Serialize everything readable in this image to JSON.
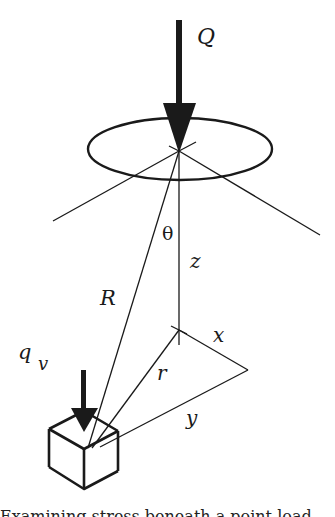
{
  "diagram": {
    "labels": {
      "load": "Q",
      "theta": "θ",
      "z": "z",
      "R": "R",
      "q": "q",
      "q_sub": "v",
      "x": "x",
      "r": "r",
      "y": "y"
    },
    "elements": [
      "vertical point load arrow Q",
      "ellipse loaded area on surface",
      "surface plane lines",
      "depth axis z",
      "radial distance R",
      "horizontal offset r with components x and y",
      "soil element cube with vertical stress q_v"
    ],
    "caption_partial": "Examining stress beneath a point load"
  }
}
